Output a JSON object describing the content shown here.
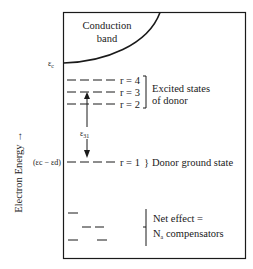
{
  "diagram": {
    "axis_label": "Electron Energy →",
    "conduction_band": {
      "line1": "Conduction",
      "line2": "band",
      "edge_label": "ε",
      "edge_label_sub": "c"
    },
    "excited_states": {
      "levels": [
        {
          "label": "r = 4"
        },
        {
          "label": "r = 3"
        },
        {
          "label": "r = 2"
        }
      ],
      "bracket_text_line1": "Excited states",
      "bracket_text_line2": "of donor"
    },
    "transition": {
      "symbol": "ε",
      "subscript": "31"
    },
    "ground_state": {
      "level_label": "r = 1",
      "text": "Donor ground state",
      "left_label": "(εc − εd)"
    },
    "compensators": {
      "line1": "Net effect =",
      "line2_prefix": "N",
      "line2_sub": "a",
      "line2_suffix": " compensators"
    },
    "colors": {
      "ink": "#1a1a1a",
      "background": "#ffffff"
    }
  }
}
